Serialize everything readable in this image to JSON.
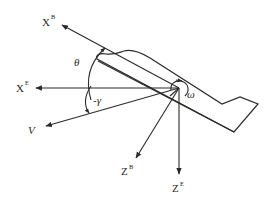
{
  "diagram": {
    "type": "aircraft-coordinate-frames",
    "axes": {
      "xb": {
        "base": "X",
        "sup": "B"
      },
      "xe": {
        "base": "X",
        "sup": "E"
      },
      "zb": {
        "base": "Z",
        "sup": "B"
      },
      "ze": {
        "base": "Z",
        "sup": "E"
      },
      "v": {
        "text": "V"
      }
    },
    "angles": {
      "theta": "θ",
      "gamma": "-γ",
      "omega": "ω"
    },
    "colors": {
      "stroke": "#2a2a2a",
      "background": "#ffffff"
    }
  }
}
